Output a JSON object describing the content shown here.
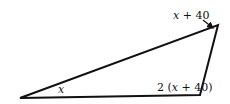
{
  "figure": {
    "type": "triangle",
    "vertices": {
      "bottom_left": [
        20,
        98
      ],
      "bottom_right": [
        200,
        95
      ],
      "top_right": [
        218,
        25
      ]
    },
    "angle_labels": {
      "bottom_left": {
        "var": "x",
        "text": "x"
      },
      "bottom_right": {
        "prefix": "2 (",
        "var": "x",
        "suffix": " + 40)"
      },
      "top_right": {
        "var": "x",
        "suffix": " + 40"
      }
    },
    "stroke_color": "#111111"
  }
}
